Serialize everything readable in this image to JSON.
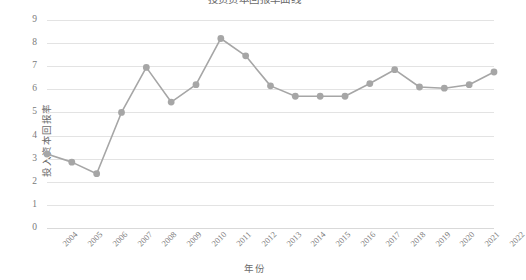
{
  "chart_data": {
    "type": "line",
    "title": "投资资本回报率曲线",
    "xlabel": "年份",
    "ylabel": "投入资本回报率",
    "categories": [
      "2004",
      "2005",
      "2006",
      "2007",
      "2008",
      "2009",
      "2010",
      "2011",
      "2012",
      "2013",
      "2014",
      "2015",
      "2016",
      "2017",
      "2018",
      "2019",
      "2020",
      "2021",
      "2022"
    ],
    "values": [
      3.2,
      2.85,
      2.35,
      5.0,
      6.95,
      5.45,
      6.2,
      8.2,
      7.45,
      6.15,
      5.7,
      5.7,
      5.7,
      6.25,
      6.85,
      6.1,
      6.05,
      6.2,
      6.75
    ],
    "ylim": [
      0,
      9
    ],
    "y_ticks": [
      0,
      1,
      2,
      3,
      4,
      5,
      6,
      7,
      8,
      9
    ],
    "grid": "horizontal",
    "legend": "none",
    "series": [
      {
        "name": "投入资本回报率",
        "values": [
          3.2,
          2.85,
          2.35,
          5.0,
          6.95,
          5.45,
          6.2,
          8.2,
          7.45,
          6.15,
          5.7,
          5.7,
          5.7,
          6.25,
          6.85,
          6.1,
          6.05,
          6.2,
          6.75
        ]
      }
    ],
    "colors": {
      "series_line": "#a6a6a6",
      "marker": "#a6a6a6",
      "gridline": "#e3e3e3",
      "text": "#7a7a7a"
    }
  }
}
